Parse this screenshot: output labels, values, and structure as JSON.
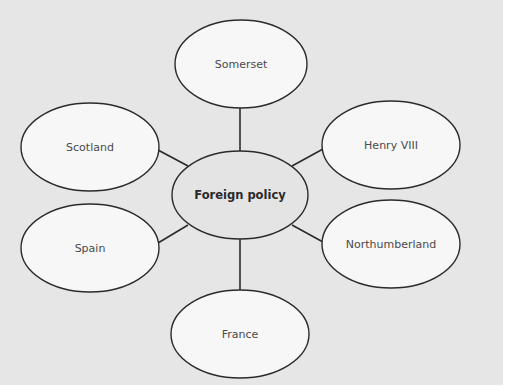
{
  "diagram": {
    "type": "mind-map",
    "colors": {
      "background": "#e6e6e6",
      "outer_fill": "#f7f7f7",
      "center_fill": "#e4e4e4",
      "stroke": "#2b2b2b"
    },
    "center": {
      "label": "Foreign policy",
      "cx": 240,
      "cy": 195,
      "rx": 68,
      "ry": 44
    },
    "nodes": [
      {
        "id": "somerset",
        "label": "Somerset",
        "cx": 241,
        "cy": 64,
        "rx": 66,
        "ry": 44
      },
      {
        "id": "henry-viii",
        "label": "Henry VIII",
        "cx": 391,
        "cy": 145,
        "rx": 69,
        "ry": 44
      },
      {
        "id": "northumberland",
        "label": "Northumberland",
        "cx": 391,
        "cy": 244,
        "rx": 69,
        "ry": 44
      },
      {
        "id": "france",
        "label": "France",
        "cx": 240,
        "cy": 334,
        "rx": 69,
        "ry": 44
      },
      {
        "id": "spain",
        "label": "Spain",
        "cx": 90,
        "cy": 248,
        "rx": 69,
        "ry": 44
      },
      {
        "id": "scotland",
        "label": "Scotland",
        "cx": 90,
        "cy": 147,
        "rx": 69,
        "ry": 44
      }
    ],
    "edges": [
      {
        "to": "somerset",
        "x1": 240,
        "y1": 151,
        "x2": 240,
        "y2": 108
      },
      {
        "to": "henry-viii",
        "x1": 292,
        "y1": 166,
        "x2": 323,
        "y2": 149
      },
      {
        "to": "northumberland",
        "x1": 292,
        "y1": 225,
        "x2": 323,
        "y2": 242
      },
      {
        "to": "france",
        "x1": 240,
        "y1": 239,
        "x2": 240,
        "y2": 290
      },
      {
        "to": "spain",
        "x1": 188,
        "y1": 225,
        "x2": 158,
        "y2": 243
      },
      {
        "to": "scotland",
        "x1": 188,
        "y1": 166,
        "x2": 158,
        "y2": 150
      }
    ]
  }
}
